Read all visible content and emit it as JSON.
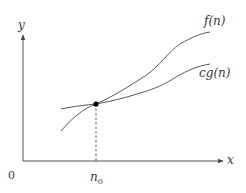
{
  "diagram": {
    "axes": {
      "y_label": "y",
      "x_label": "x",
      "origin_label": "0"
    },
    "marker": {
      "label_main": "n",
      "label_sub": "0"
    },
    "curves": [
      {
        "name": "f(n)",
        "label": "f(n)",
        "color": "#555555"
      },
      {
        "name": "cg(n)",
        "label": "cg(n)",
        "color": "#555555"
      }
    ],
    "intersection_point": {
      "label": "n0"
    }
  },
  "colors": {
    "axis": "#555555",
    "curve": "#5a5a5a",
    "point": "#000000",
    "text": "#3a3a3a",
    "background": "#ffffff"
  }
}
